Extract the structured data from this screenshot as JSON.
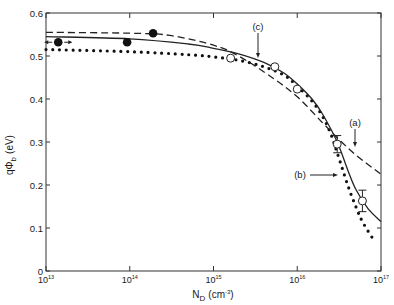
{
  "chart_data": {
    "type": "line",
    "title": "",
    "xlabel": "N_D (cm^-3)",
    "xlabel_main": "N",
    "xlabel_sub": "D",
    "xlabel_unit": "(cm",
    "xlabel_exp": "-3",
    "xlabel_close": ")",
    "ylabel": "qΦb (eV)",
    "ylabel_main": "qΦ",
    "ylabel_sub": "b",
    "ylabel_unit": "(eV)",
    "xscale": "log",
    "xlim": [
      10000000000000.0,
      1e+17
    ],
    "ylim": [
      0,
      0.6
    ],
    "grid": false,
    "x_ticks": [
      {
        "value": 10000000000000.0,
        "base": "10",
        "exp": "13"
      },
      {
        "value": 100000000000000.0,
        "base": "10",
        "exp": "14"
      },
      {
        "value": 1000000000000000.0,
        "base": "10",
        "exp": "15"
      },
      {
        "value": 1e+16,
        "base": "10",
        "exp": "16"
      },
      {
        "value": 1e+17,
        "base": "10",
        "exp": "17"
      }
    ],
    "y_ticks": [
      {
        "value": 0,
        "label": "0"
      },
      {
        "value": 0.1,
        "label": "0.1"
      },
      {
        "value": 0.2,
        "label": "0.2"
      },
      {
        "value": 0.3,
        "label": "0.3"
      },
      {
        "value": 0.4,
        "label": "0.4"
      },
      {
        "value": 0.5,
        "label": "0.5"
      },
      {
        "value": 0.6,
        "label": "0.6"
      }
    ],
    "series": [
      {
        "name": "(a)",
        "style": "dashed",
        "x": [
          10000000000000.0,
          100000000000000.0,
          300000000000000.0,
          1000000000000000.0,
          2000000000000000.0,
          5000000000000000.0,
          1e+16,
          2e+16,
          3e+16,
          5e+16,
          1e+17
        ],
        "values": [
          0.555,
          0.553,
          0.548,
          0.525,
          0.5,
          0.45,
          0.405,
          0.345,
          0.31,
          0.27,
          0.225
        ]
      },
      {
        "name": "(b)",
        "style": "dotted",
        "x": [
          10000000000000.0,
          100000000000000.0,
          500000000000000.0,
          1000000000000000.0,
          2000000000000000.0,
          4000000000000000.0,
          7000000000000000.0,
          1e+16,
          1.5e+16,
          2e+16,
          2.5e+16,
          3e+16,
          4e+16,
          5e+16,
          6e+16,
          8e+16
        ],
        "values": [
          0.515,
          0.51,
          0.503,
          0.498,
          0.49,
          0.475,
          0.455,
          0.43,
          0.395,
          0.36,
          0.32,
          0.275,
          0.2,
          0.15,
          0.115,
          0.075
        ]
      },
      {
        "name": "(c)",
        "style": "solid",
        "x": [
          10000000000000.0,
          100000000000000.0,
          500000000000000.0,
          1000000000000000.0,
          2000000000000000.0,
          4000000000000000.0,
          7000000000000000.0,
          1e+16,
          1.5e+16,
          2e+16,
          3e+16,
          4e+16,
          5e+16,
          7e+16,
          1e+17
        ],
        "values": [
          0.545,
          0.54,
          0.528,
          0.518,
          0.505,
          0.485,
          0.46,
          0.435,
          0.4,
          0.365,
          0.3,
          0.235,
          0.19,
          0.145,
          0.115
        ]
      }
    ],
    "markers": {
      "filled": [
        {
          "x": 14000000000000.0,
          "y": 0.532,
          "horizontal_arrows": true
        },
        {
          "x": 93000000000000.0,
          "y": 0.532
        },
        {
          "x": 190000000000000.0,
          "y": 0.553
        }
      ],
      "open": [
        {
          "x": 1600000000000000.0,
          "y": 0.495
        },
        {
          "x": 5400000000000000.0,
          "y": 0.475
        },
        {
          "x": 1e+16,
          "y": 0.423
        },
        {
          "x": 3e+16,
          "y": 0.295,
          "error_bar": 0.02
        },
        {
          "x": 6e+16,
          "y": 0.163,
          "error_bar": 0.025
        }
      ]
    },
    "annotations": [
      {
        "label": "(a)",
        "x_px": 355,
        "y_px": 126,
        "arrow_to": [
          355,
          147
        ]
      },
      {
        "label": "(b)",
        "x_px": 300,
        "y_px": 178,
        "arrow_to": [
          338,
          176
        ]
      },
      {
        "label": "(c)",
        "x_px": 258,
        "y_px": 30,
        "arrow_to": [
          258,
          58
        ]
      }
    ]
  }
}
